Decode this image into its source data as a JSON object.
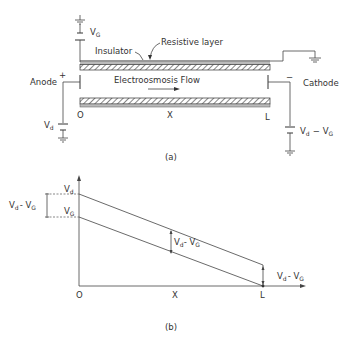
{
  "figure": {
    "part_a": {
      "caption": "(a)",
      "labels": {
        "gate_voltage": "V",
        "gate_voltage_sub": "G",
        "resistive_layer": "Resistive layer",
        "insulator": "Insulator",
        "anode": "Anode",
        "anode_sign": "+",
        "cathode": "Cathode",
        "cathode_sign": "−",
        "flow": "Electroosmosis Flow",
        "origin": "O",
        "x": "X",
        "length": "L",
        "drive_voltage": "V",
        "drive_voltage_sub": "d",
        "cathode_voltage_v1": "V",
        "cathode_voltage_sub1": "d",
        "cathode_voltage_minus": "−",
        "cathode_voltage_v2": "V",
        "cathode_voltage_sub2": "G"
      }
    },
    "part_b": {
      "caption": "(b)",
      "labels": {
        "vd": "V",
        "vd_sub": "d",
        "vg": "V",
        "vg_sub": "G",
        "left_diff": "V",
        "left_diff_sub1": "d",
        "left_diff_mid": "- V",
        "left_diff_sub2": "G",
        "mid_diff": "V",
        "mid_diff_sub1": "d",
        "mid_diff_mid": "- V",
        "mid_diff_sub2": "G",
        "right_diff": "V",
        "right_diff_sub1": "d",
        "right_diff_mid": "- V",
        "right_diff_sub2": "G",
        "origin": "O",
        "x": "X",
        "length": "L"
      }
    }
  }
}
